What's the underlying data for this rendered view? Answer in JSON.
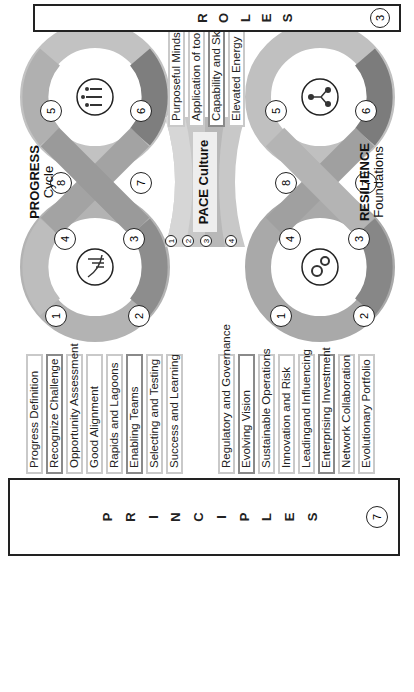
{
  "principles": {
    "title_letters": [
      "P",
      "R",
      "I",
      "N",
      "C",
      "I",
      "P",
      "L",
      "E",
      "S"
    ],
    "count": "7",
    "progress_list": [
      {
        "label": "Progress Definition",
        "emphasis": false
      },
      {
        "label": "Recognize Challenge",
        "emphasis": true
      },
      {
        "label": "Opportunity Assessment",
        "emphasis": false
      },
      {
        "label": "Good Alignment",
        "emphasis": false
      },
      {
        "label": "Rapids and Lagoons",
        "emphasis": false
      },
      {
        "label": "Enabling Teams",
        "emphasis": true
      },
      {
        "label": "Selecting and Testing",
        "emphasis": false
      },
      {
        "label": "Success and Learning",
        "emphasis": false
      }
    ],
    "resilience_list": [
      {
        "label": "Regulatory and Governance",
        "emphasis": false
      },
      {
        "label": "Evolving Vision",
        "emphasis": true
      },
      {
        "label": "Sustainable Operations",
        "emphasis": false
      },
      {
        "label": "Innovation and Risk",
        "emphasis": false
      },
      {
        "label": "Leadingand Influencing",
        "emphasis": false
      },
      {
        "label": "Enterprising Investment",
        "emphasis": true
      },
      {
        "label": "Network Collaboration",
        "emphasis": false
      },
      {
        "label": "Evolutionary Portfolio",
        "emphasis": false
      }
    ]
  },
  "roles": {
    "title_letters": [
      "R",
      "O",
      "L",
      "E",
      "S"
    ],
    "count": "3",
    "list": [
      {
        "label": "Purposeful Mindset",
        "emphasis": false
      },
      {
        "label": "Application of tools",
        "emphasis": false
      },
      {
        "label": "Capability and Skills",
        "emphasis": true
      },
      {
        "label": "Elevated Energy",
        "emphasis": false
      }
    ]
  },
  "progress_cycle": {
    "title": "PROGRESS",
    "subtitle": "Cycle",
    "steps": [
      "1",
      "2",
      "3",
      "4",
      "5",
      "6",
      "7",
      "8"
    ],
    "left_icon": "chart-growth-icon",
    "right_icon": "people-group-icon"
  },
  "resilience_foundations": {
    "title": "RESILIENCE",
    "subtitle": "Foundations",
    "steps": [
      "1",
      "2",
      "3",
      "4",
      "5",
      "6",
      "7",
      "8"
    ],
    "left_icon": "gears-icon",
    "right_icon": "hierarchy-icon"
  },
  "pace_culture": {
    "title": "PACE Culture",
    "steps": [
      "1",
      "2",
      "3",
      "4"
    ],
    "left_icon": "hand-icon",
    "right_icon": "growth-icon"
  },
  "colors": {
    "ring_light": "#c4c4c4",
    "ring_mid": "#a8a8a8",
    "ring_dark": "#7a7a7a",
    "border": "#222222"
  }
}
